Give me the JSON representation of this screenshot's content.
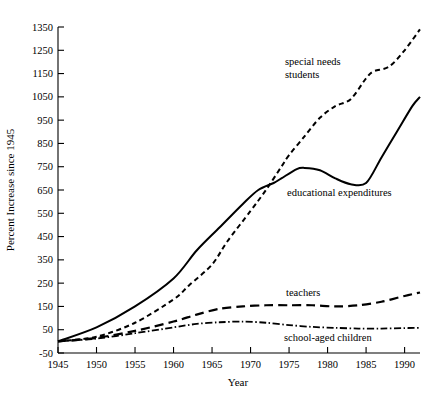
{
  "chart_data": {
    "type": "line",
    "title": "",
    "xlabel": "Year",
    "ylabel": "Percent Increase since 1945",
    "xlim": [
      1945,
      1992
    ],
    "ylim": [
      -50,
      1350
    ],
    "grid": false,
    "legend_position": "inline-annotations",
    "xticks": [
      1945,
      1950,
      1955,
      1960,
      1965,
      1970,
      1975,
      1980,
      1985,
      1990
    ],
    "yticks": [
      -50,
      50,
      150,
      250,
      350,
      450,
      550,
      650,
      750,
      850,
      950,
      1050,
      1150,
      1250,
      1350
    ],
    "xtick_labels": [
      "1945",
      "1950",
      "1955",
      "1960",
      "1965",
      "1970",
      "1975",
      "1980",
      "1985",
      "1990"
    ],
    "ytick_labels": [
      "-50",
      "50",
      "150",
      "250",
      "350",
      "450",
      "550",
      "650",
      "750",
      "850",
      "950",
      "1050",
      "1150",
      "1250",
      "1350"
    ],
    "series": [
      {
        "name": "special needs students",
        "label": "special needs students",
        "style": "short-dash",
        "color": "#000000",
        "x": [
          1945,
          1950,
          1955,
          1960,
          1962,
          1965,
          1967,
          1970,
          1972,
          1974,
          1975,
          1977,
          1979,
          1981,
          1983,
          1985,
          1986,
          1988,
          1990,
          1992
        ],
        "values": [
          0,
          20,
          80,
          180,
          240,
          330,
          430,
          560,
          650,
          750,
          800,
          880,
          960,
          1010,
          1040,
          1130,
          1160,
          1180,
          1250,
          1340
        ]
      },
      {
        "name": "educational expenditures",
        "label": "educational expenditures",
        "style": "solid",
        "color": "#000000",
        "x": [
          1945,
          1950,
          1955,
          1960,
          1963,
          1966,
          1969,
          1971,
          1973,
          1974,
          1976,
          1977,
          1979,
          1981,
          1983,
          1985,
          1987,
          1989,
          1991,
          1992
        ],
        "values": [
          0,
          60,
          150,
          270,
          390,
          490,
          590,
          650,
          680,
          700,
          740,
          745,
          735,
          700,
          675,
          680,
          790,
          900,
          1010,
          1050
        ]
      },
      {
        "name": "teachers",
        "label": "teachers",
        "style": "long-dash",
        "color": "#000000",
        "x": [
          1945,
          1950,
          1955,
          1960,
          1963,
          1966,
          1969,
          1972,
          1975,
          1978,
          1981,
          1984,
          1987,
          1990,
          1992
        ],
        "values": [
          0,
          15,
          45,
          85,
          115,
          140,
          150,
          155,
          155,
          155,
          150,
          155,
          170,
          195,
          210
        ]
      },
      {
        "name": "school-aged children",
        "label": "school-aged children",
        "style": "dash-dot",
        "color": "#000000",
        "x": [
          1945,
          1950,
          1955,
          1960,
          1963,
          1966,
          1969,
          1972,
          1975,
          1978,
          1981,
          1984,
          1987,
          1990,
          1992
        ],
        "values": [
          0,
          12,
          35,
          60,
          75,
          82,
          85,
          80,
          70,
          62,
          58,
          55,
          55,
          57,
          58
        ]
      }
    ],
    "annotations": [
      {
        "text_line1": "special needs",
        "text_line2": "students",
        "target": "special needs students"
      },
      {
        "text_line1": "educational expenditures",
        "text_line2": "",
        "target": "educational expenditures"
      },
      {
        "text_line1": "teachers",
        "text_line2": "",
        "target": "teachers"
      },
      {
        "text_line1": "school-aged children",
        "text_line2": "",
        "target": "school-aged children"
      }
    ]
  }
}
